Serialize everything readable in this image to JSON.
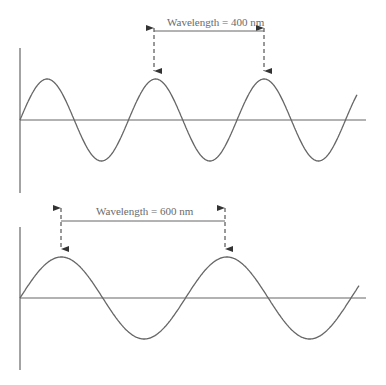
{
  "colors": {
    "stroke": "#666666",
    "text": "#6a6a6a",
    "background": "#ffffff"
  },
  "panels": [
    {
      "id": "top",
      "label": "Wavelength = 400 nm",
      "label_pos": {
        "x": 167,
        "y": 16
      },
      "axis": {
        "x": 20,
        "y_top": 48,
        "y_bottom": 193,
        "baseline_y": 120,
        "x_end": 366
      },
      "wave": {
        "x_start": 20,
        "x_end": 357,
        "amplitude": 41,
        "period": 108.5,
        "phase_start": "rising-zero"
      },
      "markers": [
        {
          "x": 154,
          "arrow_top": 20,
          "arrow_bottom": 79
        },
        {
          "x": 264,
          "arrow_top": 20,
          "arrow_bottom": 79
        }
      ],
      "bracket_y": 31
    },
    {
      "id": "bottom",
      "label": "Wavelength = 600 nm",
      "label_pos": {
        "x": 96,
        "y": 205
      },
      "axis": {
        "x": 20,
        "y_top": 227,
        "y_bottom": 370,
        "baseline_y": 298,
        "x_end": 366
      },
      "wave": {
        "x_start": 20,
        "x_end": 359,
        "amplitude": 41,
        "period": 165.5,
        "phase_start": "rising-zero"
      },
      "markers": [
        {
          "x": 61,
          "arrow_top": 200,
          "arrow_bottom": 257
        },
        {
          "x": 225,
          "arrow_top": 200,
          "arrow_bottom": 257
        }
      ],
      "bracket_y": 221
    }
  ]
}
